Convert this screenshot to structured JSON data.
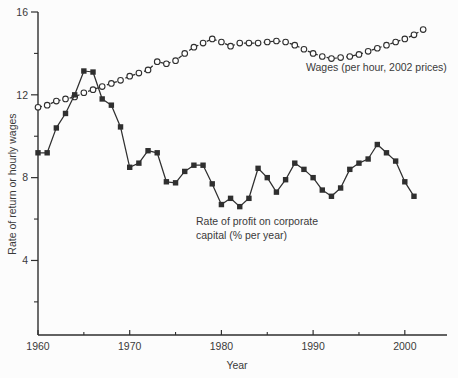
{
  "figure": {
    "kind": "scanned textbook line chart, US wages and profit rate 1960-2002"
  },
  "chart_data": {
    "type": "line",
    "title": "",
    "xlabel": "Year",
    "ylabel": "Rate of return or hourly wages",
    "xlim": [
      1960,
      2004.6
    ],
    "ylim": [
      0.4,
      16
    ],
    "grid": false,
    "legend_position": "inline-annotations",
    "x_ticks_labeled": [
      1960,
      1970,
      1980,
      1990,
      2000
    ],
    "x_ticks_minor": [
      1965,
      1975,
      1985,
      1995
    ],
    "y_ticks_labeled": [
      4,
      8,
      12,
      16
    ],
    "y_ticks_minor": [
      2,
      6,
      10,
      14
    ],
    "series": [
      {
        "name": "Wages (per hour, 2002 prices)",
        "marker": "open-circle",
        "line_style": "dashed",
        "x_start": 1960,
        "x_end": 2002,
        "values": [
          11.4,
          11.5,
          11.7,
          11.8,
          11.9,
          12.1,
          12.25,
          12.4,
          12.55,
          12.7,
          12.9,
          13.05,
          13.2,
          13.6,
          13.5,
          13.65,
          14.0,
          14.3,
          14.5,
          14.7,
          14.55,
          14.35,
          14.5,
          14.5,
          14.5,
          14.55,
          14.6,
          14.55,
          14.4,
          14.2,
          14.0,
          13.85,
          13.75,
          13.8,
          13.85,
          13.95,
          14.1,
          14.25,
          14.4,
          14.55,
          14.7,
          14.9,
          15.15
        ]
      },
      {
        "name": "Rate of profit on corporate capital (% per year)",
        "marker": "filled-square",
        "line_style": "solid",
        "x_start": 1960,
        "x_end": 2001,
        "values": [
          9.2,
          9.2,
          10.4,
          11.1,
          12.0,
          13.15,
          13.1,
          11.8,
          11.5,
          10.45,
          8.5,
          8.7,
          9.3,
          9.2,
          7.8,
          7.75,
          8.3,
          8.6,
          8.6,
          7.7,
          6.7,
          7.0,
          6.6,
          7.0,
          8.45,
          8.0,
          7.3,
          7.9,
          8.7,
          8.4,
          8.0,
          7.4,
          7.1,
          7.5,
          8.4,
          8.7,
          8.9,
          9.6,
          9.2,
          8.8,
          7.8,
          7.1
        ]
      }
    ],
    "annotations": [
      {
        "id": "wages-label",
        "text": "Wages (per hour, 2002 prices)"
      },
      {
        "id": "profit-label",
        "lines": [
          "Rate of profit on corporate",
          "capital (% per year)"
        ]
      }
    ],
    "colors": {
      "line": "#2f2f2f",
      "text": "#3a3a3a",
      "background": "#fcfcfc",
      "marker_fill": "#ffffff"
    },
    "layout": {
      "plot_left": 38,
      "plot_top": 12,
      "plot_right": 447,
      "plot_bottom": 335,
      "x_tick_len_major": 5,
      "x_tick_len_minor": 3,
      "y_tick_len_major": 7,
      "y_tick_len_minor": 4
    }
  }
}
